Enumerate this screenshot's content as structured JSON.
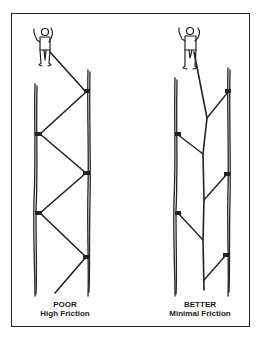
{
  "figure": {
    "panels": [
      {
        "id": "poor",
        "rating": "POOR",
        "description": "High Friction",
        "rope_path": "zig-zag between left and right cracks"
      },
      {
        "id": "better",
        "rating": "BETTER",
        "description": "Minimal Friction",
        "rope_path": "straight line with extended slings"
      }
    ],
    "colors": {
      "ink": "#222222",
      "background": "#ffffff"
    }
  }
}
